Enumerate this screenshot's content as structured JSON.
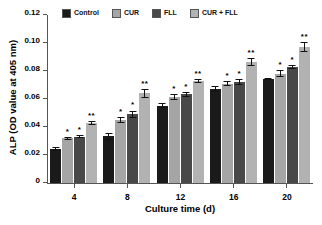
{
  "chart_data": {
    "type": "bar",
    "title": "",
    "subtitle": "",
    "xlabel": "Culture time (d)",
    "ylabel": "ALP  (OD value at 405 nm)",
    "categories": [
      "4",
      "8",
      "12",
      "16",
      "20"
    ],
    "xtick_labels": [
      "4",
      "8",
      "12",
      "16",
      "20"
    ],
    "ytick_labels": [
      "0",
      "0.02",
      "0.04",
      "0.06",
      "0.08",
      "0.10",
      "0.12"
    ],
    "ytick_values": [
      0,
      0.02,
      0.04,
      0.06,
      0.08,
      0.1,
      0.12
    ],
    "ylim": [
      0,
      0.12
    ],
    "grid": false,
    "legend_position": "top",
    "series": [
      {
        "name": "Control",
        "color": "#1a1a1a",
        "values": [
          0.0243,
          0.0333,
          0.0553,
          0.0672,
          0.0743
        ],
        "errors": [
          0.0014,
          0.0023,
          0.0016,
          0.0021,
          0.0009
        ],
        "significance": [
          "",
          "",
          "",
          "",
          ""
        ]
      },
      {
        "name": "CUR",
        "color": "#a5a5a5",
        "values": [
          0.0318,
          0.045,
          0.0615,
          0.071,
          0.0782
        ],
        "errors": [
          0.0009,
          0.002,
          0.0019,
          0.0018,
          0.0024
        ],
        "significance": [
          "*",
          "*",
          "*",
          "*",
          "*"
        ]
      },
      {
        "name": "FLL",
        "color": "#484848",
        "values": [
          0.0331,
          0.0492,
          0.0633,
          0.0723,
          0.083
        ],
        "errors": [
          0.0012,
          0.0026,
          0.0018,
          0.0021,
          0.0013
        ],
        "significance": [
          "*",
          "*",
          "*",
          "*",
          "*"
        ]
      },
      {
        "name": "CUR + FLL",
        "color": "#b2b2b2",
        "values": [
          0.043,
          0.064,
          0.0728,
          0.0865,
          0.0973
        ],
        "errors": [
          0.0016,
          0.0033,
          0.0015,
          0.0028,
          0.0037
        ],
        "significance": [
          "**",
          "**",
          "**",
          "**",
          "**"
        ]
      }
    ]
  },
  "legend": {
    "items": [
      {
        "label": "Control",
        "color": "#1a1a1a"
      },
      {
        "label": "CUR",
        "color": "#a5a5a5"
      },
      {
        "label": "FLL",
        "color": "#484848"
      },
      {
        "label": "CUR + FLL",
        "color": "#b2b2b2"
      }
    ]
  },
  "axes": {
    "y_title": "ALP  (OD value at 405 nm)",
    "x_title": "Culture time (d)"
  }
}
